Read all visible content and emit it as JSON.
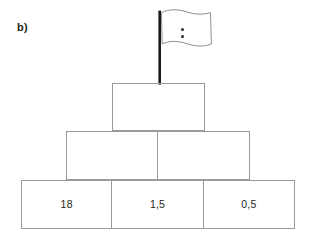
{
  "figure": {
    "part_label": "b)",
    "type": "number-pyramid",
    "flag": {
      "icon": "flag-icon",
      "marker": "two-dots",
      "dot_count": 2,
      "pole_color": "#1a1a1a",
      "banner_outline_color": "#8a8a8a",
      "dot_color": "#2a2a2a"
    },
    "border_color": "#9a9a9a",
    "background_color": "#ffffff",
    "text_color": "#231f20",
    "rows": [
      {
        "name": "top-row",
        "cells": [
          {
            "value": ""
          }
        ]
      },
      {
        "name": "middle-row",
        "cells": [
          {
            "value": ""
          },
          {
            "value": ""
          }
        ]
      },
      {
        "name": "bottom-row",
        "cells": [
          {
            "value": "18"
          },
          {
            "value": "1,5"
          },
          {
            "value": "0,5"
          }
        ]
      }
    ]
  }
}
